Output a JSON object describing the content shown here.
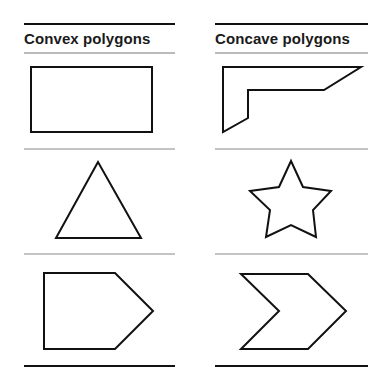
{
  "columns": [
    {
      "title": "Convex polygons",
      "shapes": [
        "rectangle",
        "triangle",
        "pentagon"
      ]
    },
    {
      "title": "Concave polygons",
      "shapes": [
        "l-shaped-polygon",
        "star",
        "chevron"
      ]
    }
  ],
  "colors": {
    "stroke": "#111111",
    "rule": "#777777",
    "background": "#ffffff"
  }
}
